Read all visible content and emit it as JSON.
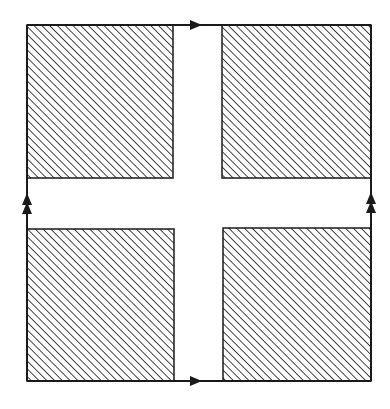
{
  "diagram": {
    "type": "torus-identification-square",
    "colors": {
      "stroke": "#1a1a1a",
      "hatch": "#333333",
      "background": "#ffffff"
    },
    "outer_square": {
      "x": 27,
      "y": 25,
      "width": 344,
      "height": 356
    },
    "edges": [
      {
        "name": "top",
        "arrow": "single",
        "direction": "right"
      },
      {
        "name": "bottom",
        "arrow": "single",
        "direction": "right"
      },
      {
        "name": "left",
        "arrow": "double",
        "direction": "up"
      },
      {
        "name": "right",
        "arrow": "double",
        "direction": "up"
      }
    ],
    "shaded_regions": [
      {
        "name": "top-left",
        "x": 27,
        "y": 25,
        "width": 146,
        "height": 153
      },
      {
        "name": "top-right",
        "x": 222,
        "y": 25,
        "width": 149,
        "height": 153
      },
      {
        "name": "bottom-left",
        "x": 27,
        "y": 229,
        "width": 147,
        "height": 152
      },
      {
        "name": "bottom-right",
        "x": 223,
        "y": 228,
        "width": 148,
        "height": 153
      }
    ]
  }
}
